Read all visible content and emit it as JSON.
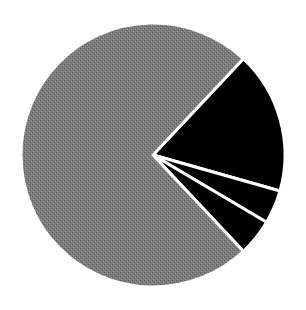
{
  "chart_data": {
    "type": "pie",
    "title": "",
    "labels": [
      "Slice 1",
      "Slice 2",
      "Slice 3",
      "Slice 4"
    ],
    "values": [
      17.4,
      4.1,
      4.5,
      74.0
    ],
    "colors": [
      "#000000",
      "#000000",
      "#000000",
      "#7a7a7a"
    ],
    "start_angle_deg": -46.8,
    "direction": "clockwise",
    "separator_color": "#ffffff",
    "legend": "none",
    "center": [
      153,
      155
    ],
    "radius": 132
  }
}
